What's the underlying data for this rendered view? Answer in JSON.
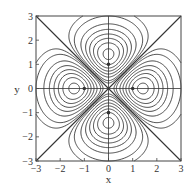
{
  "chart_data": {
    "type": "contour",
    "title": "",
    "xlabel": "x",
    "ylabel": "y",
    "xlim": [
      -3,
      3
    ],
    "ylim": [
      -3,
      3
    ],
    "xticks": [
      -3,
      -2,
      -1,
      0,
      1,
      2,
      3
    ],
    "yticks": [
      -3,
      -2,
      -1,
      0,
      1,
      2,
      3
    ],
    "xtick_labels": [
      "−3",
      "−2",
      "−1",
      "0",
      "1",
      "2",
      "3"
    ],
    "ytick_labels": [
      "−3",
      "−2",
      "−1",
      "0",
      "1",
      "2",
      "3"
    ],
    "grid": false,
    "legend": null,
    "function": "(x^2 - y^2) * exp(-(x^2 + y^2)/2)",
    "levels": [
      -0.7,
      -0.6,
      -0.5,
      -0.4,
      -0.3,
      -0.2,
      -0.1,
      -0.05,
      0.05,
      0.1,
      0.2,
      0.3,
      0.4,
      0.5,
      0.6,
      0.7
    ],
    "extrema": [
      {
        "x": 1,
        "y": 0,
        "kind": "max"
      },
      {
        "x": -1,
        "y": 0,
        "kind": "max"
      },
      {
        "x": 0,
        "y": 1,
        "kind": "min"
      },
      {
        "x": 0,
        "y": -1,
        "kind": "min"
      }
    ],
    "reference_lines": [
      {
        "type": "diagonal",
        "from": [
          -3,
          -3
        ],
        "to": [
          3,
          3
        ]
      },
      {
        "type": "diagonal",
        "from": [
          -3,
          3
        ],
        "to": [
          3,
          -3
        ]
      },
      {
        "type": "axis",
        "from": [
          -3,
          0
        ],
        "to": [
          3,
          0
        ]
      },
      {
        "type": "axis",
        "from": [
          0,
          -3
        ],
        "to": [
          0,
          3
        ]
      }
    ],
    "line_color": "#333333"
  },
  "layout": {
    "plot_left": 36,
    "plot_top": 16,
    "plot_size": 145
  }
}
